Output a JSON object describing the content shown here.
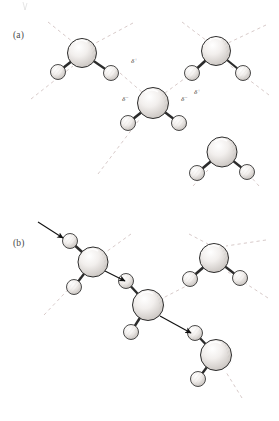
{
  "figure": {
    "panels": [
      {
        "id": "a",
        "label": "(a)",
        "caption_text": "(a)",
        "description": "Hydrogen-bonded water molecules with partial charges",
        "charge_labels": [
          {
            "id": "delta-plus-left",
            "symbol": "δ",
            "sign": "+",
            "x": 131,
            "y": 63
          },
          {
            "id": "delta-minus-left",
            "symbol": "δ",
            "sign": "−",
            "x": 122,
            "y": 101
          },
          {
            "id": "delta-minus-right",
            "symbol": "δ",
            "sign": "−",
            "x": 181,
            "y": 101
          },
          {
            "id": "delta-plus-right",
            "symbol": "δ",
            "sign": "+",
            "x": 194,
            "y": 94
          }
        ],
        "molecules": [
          {
            "id": "a-mol-top-left",
            "ox": 82,
            "oy": 53,
            "or": 14.5,
            "h1x": 58,
            "h1y": 72,
            "h2x": 111,
            "h2y": 73,
            "hr": 7.5
          },
          {
            "id": "a-mol-top-right",
            "ox": 216,
            "oy": 51,
            "or": 14.5,
            "h1x": 192,
            "h1y": 73,
            "h2x": 243,
            "h2y": 73,
            "hr": 7.5
          },
          {
            "id": "a-mol-center",
            "ox": 153,
            "oy": 103,
            "or": 15.5,
            "h1x": 128,
            "h1y": 123,
            "h2x": 179,
            "h2y": 123,
            "hr": 7.5
          },
          {
            "id": "a-mol-bottom-right",
            "ox": 222,
            "oy": 152,
            "or": 15.0,
            "h1x": 197,
            "h1y": 173,
            "h2x": 247,
            "h2y": 172,
            "hr": 7.5
          }
        ],
        "hydrogen_bond_count": 4,
        "lone_pair_line_style": "dashed"
      },
      {
        "id": "b",
        "label": "(b)",
        "caption_text": "(b)",
        "description": "Proton hopping / Grotthuss mechanism shown with arrows",
        "charge_labels": [],
        "molecules": [
          {
            "id": "b-mol-upper-left",
            "ox": 93,
            "oy": 262,
            "or": 15.0,
            "h1x": 70,
            "h1y": 241,
            "h2x": 74,
            "h2y": 287,
            "hr": 7.5
          },
          {
            "id": "b-mol-center",
            "ox": 148,
            "oy": 305,
            "or": 15.5,
            "h1x": 126,
            "h1y": 281,
            "h2x": 131,
            "h2y": 332,
            "hr": 7.5
          },
          {
            "id": "b-mol-upper-right",
            "ox": 214,
            "oy": 258,
            "or": 14.5,
            "h1x": 190,
            "h1y": 279,
            "h2x": 240,
            "h2y": 278,
            "hr": 7.5
          },
          {
            "id": "b-mol-lower-right",
            "ox": 216,
            "oy": 355,
            "or": 15.5,
            "h1x": 195,
            "h1y": 333,
            "h2x": 198,
            "h2y": 379,
            "hr": 7.5
          }
        ],
        "arrows": [
          {
            "id": "arrow-incoming-proton",
            "x1": 38,
            "y1": 222,
            "x2": 63,
            "y2": 238,
            "style": "solid"
          },
          {
            "id": "arrow-transfer-1",
            "x1": 105,
            "y1": 271,
            "x2": 125,
            "y2": 281,
            "style": "solid"
          },
          {
            "id": "arrow-transfer-2",
            "x1": 160,
            "y1": 316,
            "x2": 191,
            "y2": 333,
            "style": "solid"
          }
        ],
        "arrow_count": 3,
        "lone_pair_line_style": "dashed"
      }
    ],
    "colors": {
      "background": "#ffffff",
      "outline": "#2b2b2b",
      "sphere_fill": "#f4f2f0",
      "sphere_shade": "#c9c5c1",
      "dashed_line": "#c8b6b4",
      "arrow": "#111111",
      "label_text": "#4a4a4a"
    },
    "atoms": {
      "oxygen_name": "oxygen-sphere",
      "hydrogen_name": "hydrogen-sphere",
      "bond_name": "covalent-bond"
    },
    "top_artifact": {
      "present": true,
      "x": 23,
      "y": 2
    }
  }
}
